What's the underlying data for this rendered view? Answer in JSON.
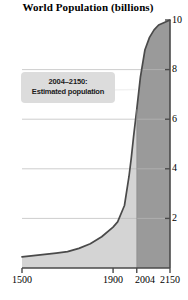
{
  "chart_data": {
    "type": "area",
    "title": "World Population (billions)",
    "xlabel": "",
    "ylabel": "",
    "xlim": [
      1500,
      2150
    ],
    "ylim": [
      0,
      10
    ],
    "grid": true,
    "legend": false,
    "yticks": [
      2,
      4,
      6,
      8,
      10
    ],
    "ytick_labels": [
      "2",
      "4",
      "6",
      "8",
      "10"
    ],
    "xticks": [
      1500,
      1900,
      2004,
      2150
    ],
    "xtick_labels": [
      "1500",
      "1900",
      "2004",
      "2150"
    ],
    "series": [
      {
        "name": "World population",
        "x": [
          1500,
          1550,
          1600,
          1650,
          1700,
          1750,
          1800,
          1850,
          1900,
          1920,
          1950,
          1970,
          1980,
          1990,
          2004,
          2020,
          2040,
          2060,
          2080,
          2100,
          2125,
          2150
        ],
        "values": [
          0.45,
          0.5,
          0.55,
          0.6,
          0.66,
          0.79,
          0.98,
          1.26,
          1.65,
          1.86,
          2.52,
          3.7,
          4.44,
          5.3,
          6.4,
          7.7,
          8.8,
          9.3,
          9.6,
          9.8,
          9.9,
          10.0
        ]
      }
    ],
    "regions": [
      {
        "name": "historical",
        "from": 1500,
        "to": 2004,
        "fill": "#d4d4d4"
      },
      {
        "name": "projected",
        "from": 2004,
        "to": 2150,
        "fill": "#9a9a9a"
      }
    ],
    "annotations": [
      {
        "name": "estimated-population-callout",
        "line1": "2004–2150:",
        "line2": "Estimated population",
        "points_to_x": 2004,
        "points_to_y": 7.2
      }
    ],
    "colors": {
      "curve": "#4a4a4a",
      "area_historical": "#d4d4d4",
      "area_projected": "#9a9a9a",
      "axis": "#4a4a4a",
      "grid": "#b8b8b8",
      "callout_bg": "#dcdcdc",
      "text": "#000000",
      "background": "#ffffff"
    }
  }
}
